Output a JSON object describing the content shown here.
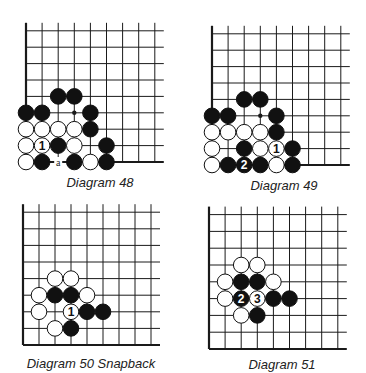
{
  "colors": {
    "line": "#1a1a1a",
    "black_stone": "#111111",
    "white_stone": "#ffffff",
    "label_on_white": "#111111",
    "label_on_black": "#ffffff"
  },
  "diagrams": [
    {
      "id": "d48",
      "caption": "Diagram 48",
      "origin": {
        "x": 26,
        "y": 162
      },
      "spacing": {
        "x": 16.1,
        "y": 16.4
      },
      "caption_pos": {
        "x": 100,
        "y": 175
      },
      "stones": [
        {
          "col": 2,
          "row": 4,
          "color": "black"
        },
        {
          "col": 3,
          "row": 4,
          "color": "black"
        },
        {
          "col": 0,
          "row": 3,
          "color": "black"
        },
        {
          "col": 1,
          "row": 3,
          "color": "black"
        },
        {
          "col": 4,
          "row": 3,
          "color": "black"
        },
        {
          "col": 0,
          "row": 2,
          "color": "white"
        },
        {
          "col": 1,
          "row": 2,
          "color": "white"
        },
        {
          "col": 2,
          "row": 2,
          "color": "white"
        },
        {
          "col": 3,
          "row": 2,
          "color": "white"
        },
        {
          "col": 4,
          "row": 2,
          "color": "black"
        },
        {
          "col": 0,
          "row": 1,
          "color": "white"
        },
        {
          "col": 1,
          "row": 1,
          "color": "white",
          "label": "1"
        },
        {
          "col": 2,
          "row": 1,
          "color": "black"
        },
        {
          "col": 3,
          "row": 1,
          "color": "white"
        },
        {
          "col": 5,
          "row": 1,
          "color": "black"
        },
        {
          "col": 0,
          "row": 0,
          "color": "white"
        },
        {
          "col": 1,
          "row": 0,
          "color": "black"
        },
        {
          "col": 3,
          "row": 0,
          "color": "black"
        },
        {
          "col": 4,
          "row": 0,
          "color": "white"
        },
        {
          "col": 5,
          "row": 0,
          "color": "black"
        }
      ],
      "marks": [
        {
          "col": 3,
          "row": 3,
          "type": "dot"
        },
        {
          "col": 2,
          "row": 0,
          "type": "letter",
          "text": "a"
        }
      ]
    },
    {
      "id": "d49",
      "caption": "Diagram 49",
      "origin": {
        "x": 212,
        "y": 165
      },
      "spacing": {
        "x": 16.1,
        "y": 16.4
      },
      "caption_pos": {
        "x": 284,
        "y": 178
      },
      "stones": [
        {
          "col": 2,
          "row": 4,
          "color": "black"
        },
        {
          "col": 3,
          "row": 4,
          "color": "black"
        },
        {
          "col": 0,
          "row": 3,
          "color": "black"
        },
        {
          "col": 1,
          "row": 3,
          "color": "black"
        },
        {
          "col": 4,
          "row": 3,
          "color": "black"
        },
        {
          "col": 0,
          "row": 2,
          "color": "white"
        },
        {
          "col": 1,
          "row": 2,
          "color": "white"
        },
        {
          "col": 2,
          "row": 2,
          "color": "white"
        },
        {
          "col": 3,
          "row": 2,
          "color": "white"
        },
        {
          "col": 4,
          "row": 2,
          "color": "black"
        },
        {
          "col": 0,
          "row": 1,
          "color": "white"
        },
        {
          "col": 2,
          "row": 1,
          "color": "black"
        },
        {
          "col": 3,
          "row": 1,
          "color": "white"
        },
        {
          "col": 4,
          "row": 1,
          "color": "white",
          "label": "1"
        },
        {
          "col": 5,
          "row": 1,
          "color": "black"
        },
        {
          "col": 0,
          "row": 0,
          "color": "white"
        },
        {
          "col": 1,
          "row": 0,
          "color": "black"
        },
        {
          "col": 2,
          "row": 0,
          "color": "black",
          "label": "2"
        },
        {
          "col": 3,
          "row": 0,
          "color": "black"
        },
        {
          "col": 4,
          "row": 0,
          "color": "white"
        },
        {
          "col": 5,
          "row": 0,
          "color": "black"
        }
      ],
      "marks": [
        {
          "col": 3,
          "row": 3,
          "type": "dot"
        }
      ]
    },
    {
      "id": "d50",
      "caption": "Diagram 50  Snapback",
      "origin": {
        "x": 23,
        "y": 345
      },
      "spacing": {
        "x": 16.0,
        "y": 16.6
      },
      "caption_pos": {
        "x": 91,
        "y": 356
      },
      "stones": [
        {
          "col": 2,
          "row": 4,
          "color": "white"
        },
        {
          "col": 3,
          "row": 4,
          "color": "white"
        },
        {
          "col": 1,
          "row": 3,
          "color": "white"
        },
        {
          "col": 2,
          "row": 3,
          "color": "black"
        },
        {
          "col": 3,
          "row": 3,
          "color": "black"
        },
        {
          "col": 4,
          "row": 3,
          "color": "white"
        },
        {
          "col": 1,
          "row": 2,
          "color": "white"
        },
        {
          "col": 3,
          "row": 2,
          "color": "white",
          "label": "1"
        },
        {
          "col": 4,
          "row": 2,
          "color": "black"
        },
        {
          "col": 5,
          "row": 2,
          "color": "black"
        },
        {
          "col": 2,
          "row": 1,
          "color": "white"
        },
        {
          "col": 3,
          "row": 1,
          "color": "black"
        }
      ],
      "marks": []
    },
    {
      "id": "d51",
      "caption": "Diagram 51",
      "origin": {
        "x": 209,
        "y": 349
      },
      "spacing": {
        "x": 16.1,
        "y": 16.8
      },
      "caption_pos": {
        "x": 282,
        "y": 357
      },
      "stones": [
        {
          "col": 2,
          "row": 5,
          "color": "white"
        },
        {
          "col": 3,
          "row": 5,
          "color": "white"
        },
        {
          "col": 1,
          "row": 4,
          "color": "white"
        },
        {
          "col": 2,
          "row": 4,
          "color": "black"
        },
        {
          "col": 3,
          "row": 4,
          "color": "black"
        },
        {
          "col": 4,
          "row": 4,
          "color": "white"
        },
        {
          "col": 1,
          "row": 3,
          "color": "white"
        },
        {
          "col": 2,
          "row": 3,
          "color": "black",
          "label": "2"
        },
        {
          "col": 3,
          "row": 3,
          "color": "white",
          "label": "3"
        },
        {
          "col": 4,
          "row": 3,
          "color": "black"
        },
        {
          "col": 5,
          "row": 3,
          "color": "black"
        },
        {
          "col": 2,
          "row": 2,
          "color": "white"
        },
        {
          "col": 3,
          "row": 2,
          "color": "black"
        }
      ],
      "marks": []
    }
  ]
}
